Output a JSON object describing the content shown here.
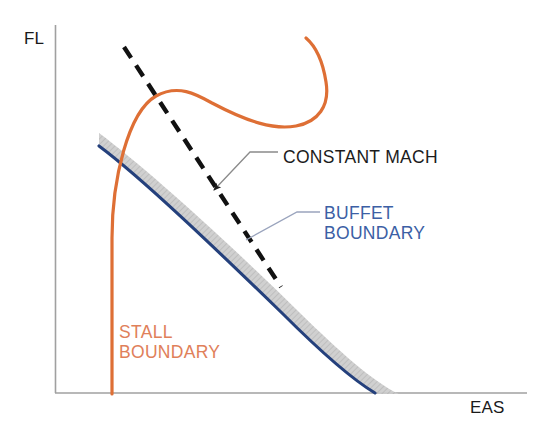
{
  "figure": {
    "type": "diagram",
    "background_color": "#ffffff"
  },
  "axes": {
    "y_label": "FL",
    "x_label": "EAS",
    "axis_color": "#9a9a9a",
    "y_axis_x": 55,
    "y_axis_top": 25,
    "y_axis_bottom": 393,
    "x_axis_y": 393,
    "x_axis_left": 55,
    "x_axis_right": 527,
    "ticks": "none",
    "grid": "off"
  },
  "curves": {
    "stall_boundary": {
      "label_line_1": "STALL",
      "label_line_2": "BOUNDARY",
      "color": "#de6f35",
      "label_color": "#e0805a",
      "stroke_width": 3.2,
      "description": "orange curve rising from x-axis, peaking then sweeping right and hooking upward"
    },
    "buffet_boundary": {
      "label_line_1": "BUFFET",
      "label_line_2": "BOUNDARY",
      "color": "#24407c",
      "label_color": "#3c5fa5",
      "stroke_width": 3.0,
      "band_color": "#c9c9c9",
      "band_width": 17,
      "description": "navy curve with grey hatched band descending left-to-right to the x-axis"
    },
    "constant_mach": {
      "label": "CONSTANT  MACH",
      "color": "#111111",
      "label_color": "#1c1c1c",
      "stroke_width": 4.4,
      "dash": "13 9",
      "description": "black dashed straight line descending from upper-left through the buffet band"
    }
  },
  "leaders": {
    "constant_mach_leader_color": "#8b8b8b",
    "buffet_leader_color": "#9aa4bd",
    "arrow_color": "#1c1c1c"
  }
}
